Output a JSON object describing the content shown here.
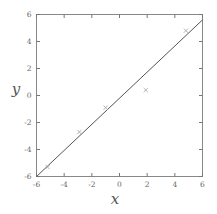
{
  "chart_data": {
    "type": "line",
    "title": "",
    "xlabel": "x",
    "ylabel": "y",
    "xlim": [
      -6,
      6
    ],
    "ylim": [
      -6,
      6
    ],
    "xticks": [
      -6,
      -4,
      -2,
      0,
      2,
      4,
      6
    ],
    "yticks": [
      -6,
      -4,
      -2,
      0,
      2,
      4,
      6
    ],
    "xticklabels": [
      "-6",
      "-4",
      "-2",
      "0",
      "2",
      "4",
      "6"
    ],
    "yticklabels": [
      "-6",
      "-4",
      "-2",
      "0",
      "2",
      "4",
      "6"
    ],
    "grid": false,
    "legend": null,
    "frame": "box",
    "series": [
      {
        "name": "fit-line",
        "kind": "line",
        "color": "#555555",
        "linewidth": 1,
        "x": [
          -6,
          6
        ],
        "values": [
          -6,
          5.6
        ]
      },
      {
        "name": "data-points",
        "kind": "scatter",
        "marker": "x",
        "color": "#aaaaaa",
        "x": [
          -5.2,
          -2.9,
          -1.0,
          1.9,
          4.8
        ],
        "values": [
          -5.3,
          -2.7,
          -0.9,
          0.4,
          4.8
        ]
      }
    ]
  },
  "figure": {
    "background_color": "#ffffff",
    "axis_color": "#777777",
    "tick_label_color": "#666666"
  }
}
